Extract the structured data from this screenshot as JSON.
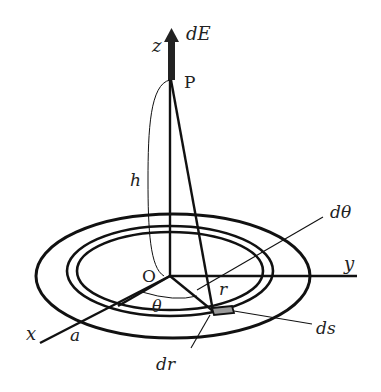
{
  "figure": {
    "labels": {
      "z_axis": "z",
      "y_axis": "y",
      "x_axis": "x",
      "origin": "O",
      "point": "P",
      "field_element": "dE",
      "height": "h",
      "radius": "r",
      "outer_radius": "a",
      "angle": "θ",
      "angle_element": "dθ",
      "area_element": "ds",
      "radius_element": "dr"
    },
    "colors": {
      "ink": "#111111",
      "area_fill": "#9a9a9a",
      "background": "#ffffff"
    }
  }
}
